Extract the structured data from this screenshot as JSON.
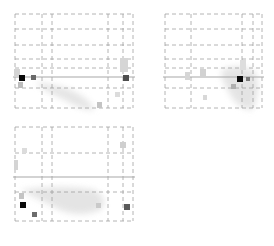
{
  "figure": {
    "colors": {
      "grid": "#9a9a9a",
      "crosshair": "#a8a8a8",
      "peak": "#0a0a0a",
      "strong": "#5a5a5a",
      "blob": "#c8c8c8"
    }
  },
  "panels": [
    {
      "view": "sagittal",
      "box": {
        "x": 15,
        "y": 14,
        "w": 118,
        "h": 94
      },
      "vlines": [
        15,
        42,
        52,
        108,
        123,
        133
      ],
      "hlines": [
        14,
        29,
        45,
        59,
        68,
        88,
        108
      ],
      "crosshair_y": 77,
      "blobs": [
        {
          "x": 14,
          "y": 69,
          "w": 6,
          "h": 8,
          "shade": "#d4d4d4"
        },
        {
          "x": 19,
          "y": 75,
          "w": 6,
          "h": 6,
          "shade": "#0a0a0a"
        },
        {
          "x": 31,
          "y": 75,
          "w": 5,
          "h": 5,
          "shade": "#6a6a6a"
        },
        {
          "x": 18,
          "y": 82,
          "w": 5,
          "h": 6,
          "shade": "#bdbdbd"
        },
        {
          "x": 123,
          "y": 75,
          "w": 6,
          "h": 6,
          "shade": "#4e4e4e"
        },
        {
          "x": 120,
          "y": 58,
          "w": 8,
          "h": 14,
          "shade": "#d6d6d6"
        },
        {
          "x": 97,
          "y": 102,
          "w": 5,
          "h": 6,
          "shade": "#c4c4c4"
        },
        {
          "x": 115,
          "y": 92,
          "w": 5,
          "h": 5,
          "shade": "#dcdcdc"
        }
      ],
      "cloud": "M35 82 Q60 85 75 92 Q90 100 95 110 Q80 110 65 100 Q45 92 35 82 Z"
    },
    {
      "view": "coronal",
      "box": {
        "x": 165,
        "y": 14,
        "w": 97,
        "h": 94
      },
      "vlines": [
        165,
        191,
        242,
        253,
        262
      ],
      "hlines": [
        14,
        29,
        45,
        59,
        68,
        88,
        108
      ],
      "crosshair_y": 77,
      "blobs": [
        {
          "x": 237,
          "y": 76,
          "w": 6,
          "h": 6,
          "shade": "#0a0a0a"
        },
        {
          "x": 246,
          "y": 77,
          "w": 4,
          "h": 4,
          "shade": "#7a7a7a"
        },
        {
          "x": 231,
          "y": 84,
          "w": 5,
          "h": 5,
          "shade": "#b0b0b0"
        },
        {
          "x": 200,
          "y": 69,
          "w": 6,
          "h": 8,
          "shade": "#d2d2d2"
        },
        {
          "x": 185,
          "y": 72,
          "w": 5,
          "h": 8,
          "shade": "#d6d6d6"
        },
        {
          "x": 203,
          "y": 95,
          "w": 4,
          "h": 5,
          "shade": "#d8d8d8"
        },
        {
          "x": 240,
          "y": 60,
          "w": 6,
          "h": 10,
          "shade": "#dddddd"
        }
      ],
      "cloud": "M222 70 Q240 62 255 72 Q262 90 252 110 Q235 108 228 90 Q220 80 222 70 Z"
    },
    {
      "view": "axial",
      "box": {
        "x": 15,
        "y": 127,
        "w": 118,
        "h": 94
      },
      "vlines": [
        15,
        42,
        52,
        108,
        123,
        133
      ],
      "hlines": [
        127,
        153,
        192,
        221
      ],
      "crosshair_y": 177,
      "blobs": [
        {
          "x": 20,
          "y": 202,
          "w": 6,
          "h": 6,
          "shade": "#0a0a0a"
        },
        {
          "x": 32,
          "y": 212,
          "w": 5,
          "h": 5,
          "shade": "#6c6c6c"
        },
        {
          "x": 124,
          "y": 204,
          "w": 6,
          "h": 6,
          "shade": "#5a5a5a"
        },
        {
          "x": 19,
          "y": 193,
          "w": 5,
          "h": 6,
          "shade": "#c4c4c4"
        },
        {
          "x": 96,
          "y": 203,
          "w": 5,
          "h": 5,
          "shade": "#cacaca"
        },
        {
          "x": 120,
          "y": 142,
          "w": 6,
          "h": 6,
          "shade": "#cfcfcf"
        },
        {
          "x": 14,
          "y": 160,
          "w": 4,
          "h": 10,
          "shade": "#d4d4d4"
        },
        {
          "x": 22,
          "y": 148,
          "w": 5,
          "h": 5,
          "shade": "#dcdcdc"
        }
      ],
      "cloud": "M20 190 Q40 200 60 210 Q80 218 100 210 Q110 200 95 190 Q70 185 40 188 Z"
    }
  ]
}
